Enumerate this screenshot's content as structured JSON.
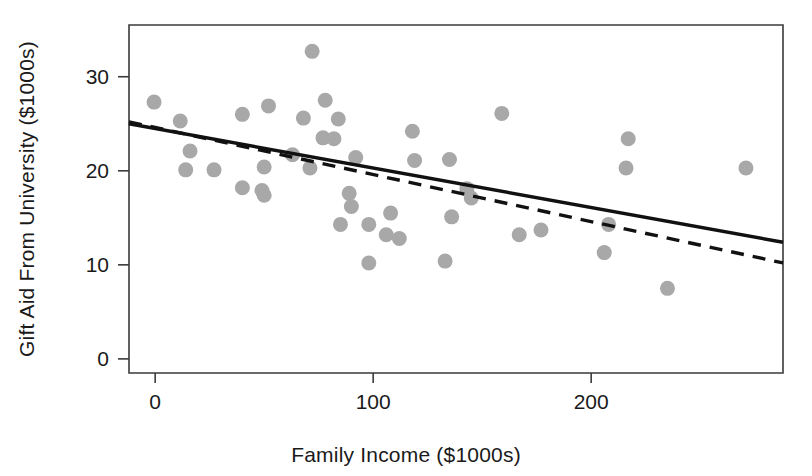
{
  "chart_data": {
    "type": "scatter",
    "title": "",
    "xlabel": "Family Income ($1000s)",
    "ylabel": "Gift Aid From University ($1000s)",
    "xlim": [
      -12,
      288
    ],
    "ylim": [
      -1.5,
      35.5
    ],
    "xticks": [
      0,
      100,
      200
    ],
    "xtick_labels": [
      "0",
      "100",
      "200"
    ],
    "yticks": [
      0,
      10,
      20,
      30
    ],
    "ytick_labels": [
      "0",
      "10",
      "20",
      "30"
    ],
    "grid": false,
    "legend": "none",
    "point_color": "#a8a8a8",
    "line_color": "#111111",
    "frame_color": "#3a3a3a",
    "x": [
      -0.5,
      11.5,
      14.0,
      16.0,
      27.0,
      40.0,
      40.0,
      49.0,
      50.0,
      50.0,
      52.0,
      63.0,
      68.0,
      71.0,
      72.0,
      77.0,
      78.0,
      82.0,
      84.0,
      85.0,
      89.0,
      90.0,
      92.0,
      98.0,
      98.0,
      106.0,
      108.0,
      112.0,
      118.0,
      119.0,
      133.0,
      135.0,
      136.0,
      143.0,
      145.0,
      159.0,
      167.0,
      177.0,
      206.0,
      208.0,
      216.0,
      217.0,
      235.0,
      271.0
    ],
    "y": [
      27.3,
      25.3,
      20.1,
      22.1,
      20.1,
      26.0,
      18.2,
      17.9,
      17.4,
      20.4,
      26.9,
      21.7,
      25.6,
      20.3,
      32.7,
      23.5,
      27.5,
      23.4,
      25.5,
      14.3,
      17.6,
      16.2,
      21.4,
      14.3,
      10.2,
      13.2,
      15.5,
      12.8,
      24.2,
      21.1,
      10.4,
      21.2,
      15.1,
      18.1,
      17.1,
      26.1,
      13.2,
      13.7,
      11.3,
      14.3,
      20.3,
      23.4,
      7.5,
      20.3
    ],
    "series": [
      {
        "name": "least-squares-fit-solid",
        "style": "solid",
        "x": [
          -12,
          288
        ],
        "y": [
          25.0,
          12.4
        ]
      },
      {
        "name": "alternative-fit-dashed",
        "style": "dashed",
        "x": [
          -12,
          288
        ],
        "y": [
          25.2,
          10.2
        ]
      }
    ]
  },
  "axes": {
    "x_label": "Family Income ($1000s)",
    "y_label": "Gift Aid From University ($1000s)",
    "x_tick_labels": [
      "0",
      "100",
      "200"
    ],
    "y_tick_labels": [
      "0",
      "10",
      "20",
      "30"
    ]
  }
}
